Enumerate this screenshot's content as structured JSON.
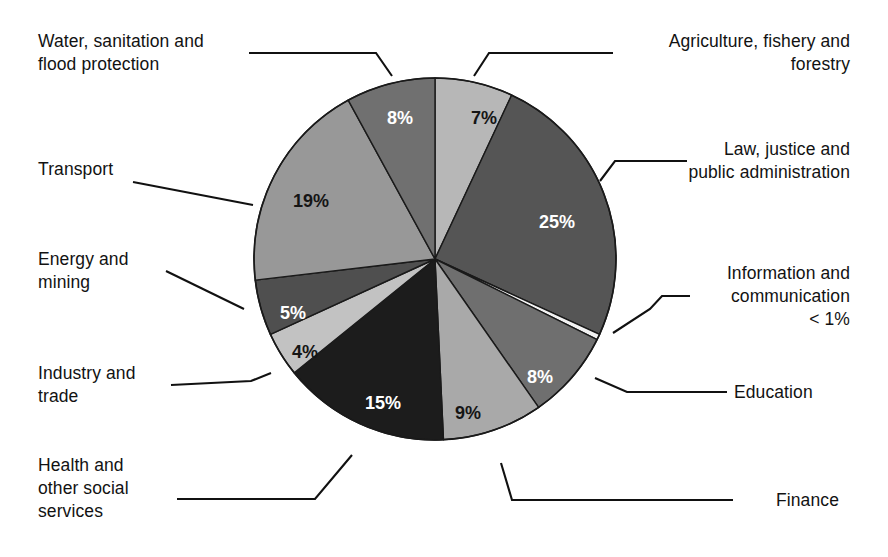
{
  "chart_data": {
    "type": "pie",
    "title": "",
    "subtitle": "",
    "xlabel": "",
    "ylabel": "",
    "legend_position": "callout-labels",
    "grid": false,
    "value_unit": "percent",
    "start_angle_deg": 0,
    "direction": "clockwise",
    "categories": [
      "Agriculture, fishery and forestry",
      "Law, justice and public administration",
      "Information and communication",
      "Education",
      "Finance",
      "Health and other social services",
      "Industry and trade",
      "Energy and mining",
      "Transport",
      "Water, sanitation and flood protection"
    ],
    "values": [
      7,
      25,
      0.5,
      8,
      9,
      15,
      4,
      5,
      19,
      8
    ],
    "value_labels": [
      "7%",
      "25%",
      "< 1%",
      "8%",
      "9%",
      "15%",
      "4%",
      "5%",
      "19%",
      "8%"
    ],
    "slice_colors": [
      "#b7b7b7",
      "#555555",
      "#f2f2f2",
      "#6f6f6f",
      "#a9a9a9",
      "#1c1c1c",
      "#c2c2c2",
      "#4f4f4f",
      "#989898",
      "#707070"
    ],
    "slices": [
      {
        "name": "Agriculture, fishery and forestry",
        "value": 7,
        "value_label": "7%",
        "color": "#b7b7b7",
        "label_color": "dark",
        "callout_side": "top-right"
      },
      {
        "name": "Law, justice and public administration",
        "value": 25,
        "value_label": "25%",
        "color": "#555555",
        "label_color": "light",
        "callout_side": "right"
      },
      {
        "name": "Information and communication",
        "value": 0.5,
        "value_label": "< 1%",
        "color": "#f2f2f2",
        "label_color": "none",
        "callout_side": "right"
      },
      {
        "name": "Education",
        "value": 8,
        "value_label": "8%",
        "color": "#6f6f6f",
        "label_color": "light",
        "callout_side": "right"
      },
      {
        "name": "Finance",
        "value": 9,
        "value_label": "9%",
        "color": "#a9a9a9",
        "label_color": "dark",
        "callout_side": "bottom-right"
      },
      {
        "name": "Health and other social services",
        "value": 15,
        "value_label": "15%",
        "color": "#1c1c1c",
        "label_color": "light",
        "callout_side": "bottom-left"
      },
      {
        "name": "Industry and trade",
        "value": 4,
        "value_label": "4%",
        "color": "#c2c2c2",
        "label_color": "dark",
        "callout_side": "left"
      },
      {
        "name": "Energy and mining",
        "value": 5,
        "value_label": "5%",
        "color": "#4f4f4f",
        "label_color": "light",
        "callout_side": "left"
      },
      {
        "name": "Transport",
        "value": 19,
        "value_label": "19%",
        "color": "#989898",
        "label_color": "dark",
        "callout_side": "left"
      },
      {
        "name": "Water, sanitation and flood protection",
        "value": 8,
        "value_label": "8%",
        "color": "#707070",
        "label_color": "light",
        "callout_side": "top-left"
      }
    ]
  },
  "callouts": {
    "water": "Water, sanitation and\nflood protection",
    "transport": "Transport",
    "energy": "Energy and\nmining",
    "industry": "Industry and\ntrade",
    "health": "Health and\nother social\nservices",
    "agriculture": "Agriculture, fishery and\nforestry",
    "law": "Law, justice and\npublic administration",
    "information": "Information and\ncommunication\n< 1%",
    "education": "Education",
    "finance": "Finance"
  },
  "slice_value_labels": {
    "water": "8%",
    "transport": "19%",
    "energy": "5%",
    "industry": "4%",
    "health": "15%",
    "agriculture": "7%",
    "law": "25%",
    "education": "8%",
    "finance": "9%"
  },
  "colors": {
    "background": "#ffffff",
    "text": "#121212",
    "leader_line": "#111111",
    "slice_outline": "#1a1a1a"
  }
}
